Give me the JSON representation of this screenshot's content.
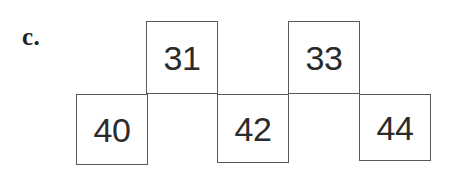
{
  "figure": {
    "part_label": "c.",
    "type": "number-pattern-staircase",
    "background_color": "#ffffff",
    "border_color": "#58585a",
    "text_color": "#2b2b2b",
    "cells": [
      {
        "value": "40",
        "row": "bottom",
        "x": 76,
        "y": 94,
        "w": 72,
        "h": 71
      },
      {
        "value": "31",
        "row": "top",
        "x": 146,
        "y": 21,
        "w": 72,
        "h": 73
      },
      {
        "value": "42",
        "row": "bottom",
        "x": 217,
        "y": 94,
        "w": 72,
        "h": 69
      },
      {
        "value": "33",
        "row": "top",
        "x": 288,
        "y": 21,
        "w": 72,
        "h": 73
      },
      {
        "value": "44",
        "row": "bottom",
        "x": 359,
        "y": 94,
        "w": 72,
        "h": 67
      }
    ],
    "label_position": {
      "x": 22,
      "y": 24
    }
  }
}
